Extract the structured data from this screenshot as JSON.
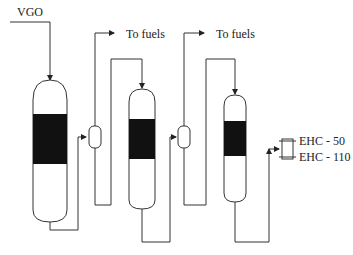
{
  "diagram": {
    "type": "process-flow",
    "feed_label": "VGO",
    "outlets": [
      {
        "label": "To fuels"
      },
      {
        "label": "To fuels"
      }
    ],
    "products": [
      {
        "label": "EHC - 50"
      },
      {
        "label": "EHC - 110"
      }
    ],
    "reactors": [
      {
        "name": "reactor-1",
        "stage": 1
      },
      {
        "name": "reactor-2",
        "stage": 2
      },
      {
        "name": "reactor-3",
        "stage": 3
      }
    ],
    "separators": [
      {
        "name": "separator-1"
      },
      {
        "name": "separator-2"
      }
    ],
    "colors": {
      "line": "#333333",
      "catalyst_bed": "#111111",
      "background": "#ffffff"
    }
  }
}
